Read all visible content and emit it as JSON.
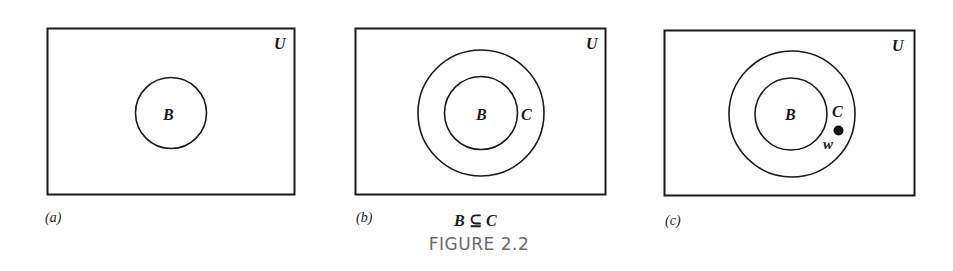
{
  "figure": {
    "caption": "FIGURE 2.2",
    "panels": [
      {
        "id": "a",
        "sublabel": "(a)",
        "universe_label": "U",
        "sets": [
          {
            "name": "B",
            "label": "B"
          }
        ],
        "relation": ""
      },
      {
        "id": "b",
        "sublabel": "(b)",
        "universe_label": "U",
        "sets": [
          {
            "name": "B",
            "label": "B"
          },
          {
            "name": "C",
            "label": "C"
          }
        ],
        "relation": "B ⊆ C"
      },
      {
        "id": "c",
        "sublabel": "(c)",
        "universe_label": "U",
        "sets": [
          {
            "name": "B",
            "label": "B"
          },
          {
            "name": "C",
            "label": "C"
          }
        ],
        "point_label": "w",
        "relation": ""
      }
    ]
  }
}
